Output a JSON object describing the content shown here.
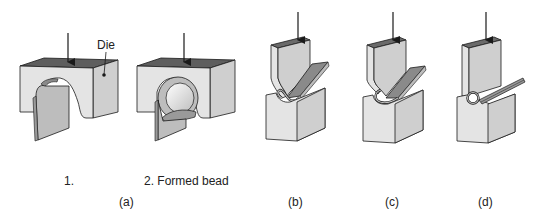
{
  "figure": {
    "panels": [
      {
        "id": "a",
        "label": "(a)",
        "steps": [
          {
            "id": "a1",
            "label": "1."
          },
          {
            "id": "a2",
            "label": "2. Formed bead"
          }
        ]
      },
      {
        "id": "b",
        "label": "(b)"
      },
      {
        "id": "c",
        "label": "(c)"
      },
      {
        "id": "d",
        "label": "(d)"
      }
    ],
    "callouts": {
      "die": "Die"
    },
    "colors": {
      "face_light": "#e4e4e4",
      "face_side": "#cfcfcf",
      "face_top": "#5e5e5e",
      "sheet": "#a9a9a9",
      "outline": "#1a1a1a"
    }
  }
}
